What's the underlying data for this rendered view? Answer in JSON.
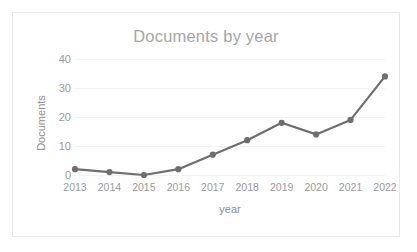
{
  "chart_data": {
    "type": "line",
    "title": "Documents by year",
    "xlabel": "year",
    "ylabel": "Documents",
    "categories": [
      "2013",
      "2014",
      "2015",
      "2016",
      "2017",
      "2018",
      "2019",
      "2020",
      "2021",
      "2022"
    ],
    "values": [
      2,
      1,
      0,
      2,
      7,
      12,
      18,
      14,
      19,
      34
    ],
    "series": [
      {
        "name": "Documents",
        "values": [
          2,
          1,
          0,
          2,
          7,
          12,
          18,
          14,
          19,
          34
        ]
      }
    ],
    "ylim": [
      0,
      40
    ],
    "yticks": [
      0,
      10,
      20,
      30,
      40
    ],
    "ytick_labels": [
      "0",
      "10",
      "20",
      "30",
      "40"
    ],
    "xtick_labels": [
      "2013",
      "2014",
      "2015",
      "2016",
      "2017",
      "2018",
      "2019",
      "2020",
      "2021",
      "2022"
    ],
    "grid": true,
    "grid_axis": "y",
    "legend": false,
    "legend_position": "none",
    "markers": true,
    "colors": {
      "line": "#6e6e6e",
      "marker": "#6e6e6e",
      "gridline": "#f2f2f2",
      "title_text": "#a6a6a6",
      "tick_text": "#9a9a9a",
      "axis_title_text": "#8f8f8f",
      "plot_background": "#ffffff",
      "frame_border": "#e8e8e8"
    }
  }
}
